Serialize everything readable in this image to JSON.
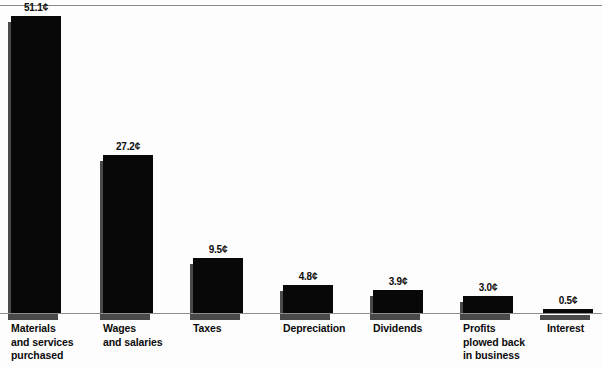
{
  "chart_data": {
    "type": "bar",
    "title": "",
    "subtitle": "",
    "xlabel": "",
    "ylabel": "",
    "unit": "¢",
    "grid": false,
    "legend": null,
    "ylim": [
      0,
      51.1
    ],
    "categories": [
      "Materials\nand services\npurchased",
      "Wages\nand salaries",
      "Taxes",
      "Depreciation",
      "Dividends",
      "Profits\nplowed back\nin business",
      "Interest"
    ],
    "values": [
      51.1,
      27.2,
      9.5,
      4.8,
      3.9,
      3.0,
      0.5
    ],
    "value_labels": [
      "51.1¢",
      "27.2¢",
      "9.5¢",
      "4.8¢",
      "3.9¢",
      "3.0¢",
      "0.5¢"
    ],
    "bar_color": "#080808",
    "shadow_color": "#4a4a4a",
    "background_color": "#fdfdfd",
    "axis_color": "#8d8d8d",
    "bars": [
      {
        "label": "Materials\nand services\npurchased",
        "value": 51.1,
        "value_label": "51.1¢",
        "x": 11,
        "width": 50
      },
      {
        "label": "Wages\nand salaries",
        "value": 27.2,
        "value_label": "27.2¢",
        "x": 103,
        "width": 50
      },
      {
        "label": "Taxes",
        "value": 9.5,
        "value_label": "9.5¢",
        "x": 193,
        "width": 50
      },
      {
        "label": "Depreciation",
        "value": 4.8,
        "value_label": "4.8¢",
        "x": 283,
        "width": 50
      },
      {
        "label": "Dividends",
        "value": 3.9,
        "value_label": "3.9¢",
        "x": 373,
        "width": 50
      },
      {
        "label": "Profits\nplowed back\nin business",
        "value": 3.0,
        "value_label": "3.0¢",
        "x": 463,
        "width": 50
      },
      {
        "label": "Interest",
        "value": 0.5,
        "value_label": "0.5¢",
        "x": 543,
        "width": 50
      }
    ],
    "label_offsets": [
      11,
      103,
      193,
      283,
      373,
      463,
      547
    ]
  }
}
